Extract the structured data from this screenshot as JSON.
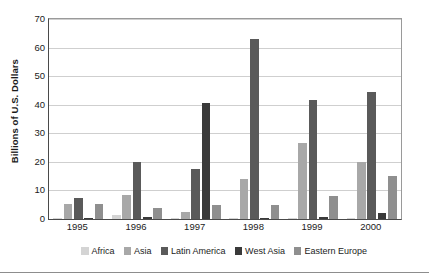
{
  "chart_data": {
    "type": "bar",
    "title": "",
    "subtitle": "",
    "xlabel": "",
    "ylabel": "Billions of U.S. Dollars",
    "categories": [
      "1995",
      "1996",
      "1997",
      "1998",
      "1999",
      "2000"
    ],
    "ylim": [
      0,
      70
    ],
    "yticks": [
      0,
      10,
      20,
      30,
      40,
      50,
      60,
      70
    ],
    "ytick_labels": [
      "0",
      "10",
      "20",
      "30",
      "40",
      "50",
      "60",
      "70"
    ],
    "grid": "horizontal",
    "legend_position": "bottom",
    "series": [
      {
        "name": "Africa",
        "color": "#d4d4d4",
        "values": [
          0.3,
          1.3,
          0.5,
          0.5,
          0.5,
          0.5
        ]
      },
      {
        "name": "Asia",
        "color": "#a8a8a8",
        "values": [
          5.2,
          8.3,
          2.5,
          14.0,
          26.5,
          19.8
        ]
      },
      {
        "name": "Latin America",
        "color": "#5a5a5a",
        "values": [
          7.5,
          19.8,
          17.5,
          63.0,
          41.5,
          44.5
        ]
      },
      {
        "name": "West Asia",
        "color": "#3a3a3a",
        "values": [
          0.5,
          0.8,
          40.5,
          0.5,
          0.6,
          2.0
        ]
      },
      {
        "name": "Eastern Europe",
        "color": "#8f8f8f",
        "values": [
          5.4,
          3.9,
          5.0,
          4.9,
          8.0,
          15.2
        ]
      }
    ]
  },
  "axis": {
    "y_title": "Billions of U.S. Dollars"
  },
  "colors": {
    "axis_line": "#4a4a4a",
    "gridline": "#cfcfcf",
    "text": "#1b1b1b",
    "background": "#ffffff"
  }
}
